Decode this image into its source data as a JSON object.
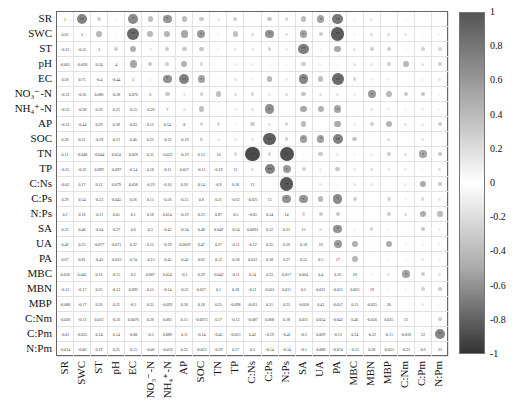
{
  "chart_data": {
    "type": "heatmap",
    "title": "",
    "variables": [
      "SR",
      "SWC",
      "ST",
      "pH",
      "EC",
      "NO₃⁻-N",
      "NH₄⁺-N",
      "AP",
      "SOC",
      "TN",
      "TP",
      "C:Ns",
      "C:Ps",
      "N:Ps",
      "SA",
      "UA",
      "PA",
      "MBC",
      "MBN",
      "MBP",
      "C:Nm",
      "C:Pm",
      "N:Pm"
    ],
    "lower_triangle": [
      [],
      [
        0.62
      ],
      [
        -0.23,
        -0.35
      ],
      [
        -0.061,
        -0.028,
        0.24
      ],
      [
        0.58,
        0.75,
        -0.4,
        -0.44
      ],
      [
        -0.33,
        -0.36,
        0.086,
        -0.28,
        0.076
      ],
      [
        -0.53,
        -0.38,
        0.26,
        0.23,
        -0.55,
        -0.28
      ],
      [
        -0.33,
        -0.44,
        0.29,
        0.38,
        -0.63,
        0.12,
        0.14
      ],
      [
        0.28,
        0.51,
        -0.29,
        -0.21,
        0.46,
        0.22,
        -0.32,
        -0.19
      ],
      [
        0.11,
        -0.048,
        -0.044,
        0.014,
        0.029,
        0.32,
        -0.032,
        -0.19,
        0.12
      ],
      [
        -0.25,
        -0.32,
        0.099,
        -0.097,
        -0.14,
        0.18,
        -0.11,
        0.057,
        -0.11,
        -0.19
      ],
      [
        -0.02,
        0.17,
        0.12,
        0.079,
        0.058,
        -0.19,
        -0.16,
        0.26,
        0.14,
        -0.9,
        0.18
      ],
      [
        0.29,
        0.54,
        -0.22,
        -0.045,
        0.36,
        0.11,
        -0.56,
        -0.15,
        0.8,
        0.21,
        -0.62,
        -0.021
      ],
      [
        0.2,
        0.16,
        -0.11,
        0.05,
        0.1,
        0.18,
        0.014,
        -0.19,
        0.23,
        0.87,
        -0.5,
        -0.83,
        0.54
      ],
      [
        0.33,
        0.46,
        -0.64,
        -0.27,
        0.6,
        0.3,
        -0.43,
        -0.34,
        0.48,
        0.049,
        -0.24,
        0.0093,
        0.52,
        0.21
      ],
      [
        0.46,
        0.25,
        -0.077,
        -0.071,
        0.32,
        0.15,
        -0.39,
        -0.0029,
        0.47,
        0.27,
        -0.11,
        -0.12,
        0.35,
        0.26,
        0.18
      ],
      [
        0.67,
        0.81,
        -0.43,
        -0.033,
        0.74,
        -0.13,
        -0.45,
        -0.42,
        0.62,
        0.12,
        -0.28,
        0.033,
        0.58,
        0.27,
        0.53,
        0.5
      ],
      [
        0.058,
        0.045,
        0.16,
        -0.15,
        0.2,
        0.087,
        0.014,
        -0.1,
        0.29,
        -0.042,
        -0.11,
        0.14,
        0.23,
        0.017,
        0.064,
        0.4,
        0.36
      ],
      [
        -0.12,
        -0.17,
        0.25,
        -0.12,
        0.092,
        0.51,
        -0.14,
        -0.25,
        0.027,
        0.1,
        0.18,
        -0.11,
        -0.011,
        0.011,
        0.2,
        0.021,
        -0.011,
        0.063
      ],
      [
        -0.008,
        -0.17,
        0.26,
        0.22,
        -0.1,
        0.35,
        -0.092,
        0.38,
        0.18,
        0.25,
        -0.098,
        -0.011,
        0.21,
        0.25,
        -0.058,
        0.41,
        -0.057,
        0.15,
        -0.035
      ],
      [
        -0.036,
        -0.13,
        0.032,
        -0.36,
        0.0076,
        0.28,
        0.062,
        0.15,
        -0.0073,
        0.17,
        -0.12,
        -0.087,
        0.068,
        0.18,
        0.031,
        0.054,
        -0.043,
        0.46,
        -0.056,
        0.025
      ],
      [
        -0.01,
        -0.025,
        0.24,
        0.14,
        -0.08,
        -0.3,
        0.089,
        0.11,
        -0.14,
        -0.45,
        -0.023,
        0.42,
        -0.19,
        -0.41,
        -0.3,
        0.069,
        -0.13,
        0.24,
        -0.22,
        -0.11,
        -0.018
      ],
      [
        -0.014,
        -0.06,
        0.19,
        0.25,
        -0.15,
        -0.06,
        -0.059,
        0.25,
        -0.023,
        -0.29,
        0.17,
        0.3,
        -0.14,
        -0.34,
        -0.1,
        0.088,
        -0.074,
        -0.15,
        0.28,
        -0.051,
        -0.23,
        0.6
      ]
    ],
    "diagonal_labels": [
      "1",
      "2",
      "3",
      "4",
      "5",
      "6",
      "7",
      "8",
      "9",
      "10",
      "11",
      "12",
      "13",
      "14",
      "15",
      "16",
      "17",
      "18",
      "19",
      "20",
      "21",
      "22",
      "23"
    ],
    "upper_triangle": "circles sized/shaded by |r|, with significance stars",
    "colorbar": {
      "min": -1,
      "max": 1,
      "ticks": [
        "1",
        "0.8",
        "0.6",
        "0.4",
        "0.2",
        "0",
        "-0.2",
        "-0.4",
        "-0.6",
        "-0.8",
        "-1"
      ]
    },
    "xlabel": "",
    "ylabel": ""
  },
  "caption": ""
}
